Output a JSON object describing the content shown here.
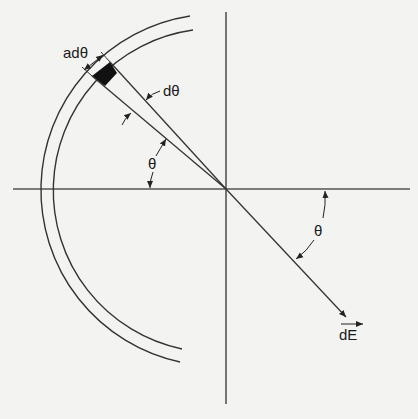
{
  "diagram": {
    "labels": {
      "arc_element": "adθ",
      "angle_increment": "dθ",
      "angle_left": "θ",
      "angle_right": "θ",
      "field_vector": "dE"
    },
    "colors": {
      "line": "#333333",
      "element_fill": "#111111",
      "background": "#f3f3f2"
    }
  }
}
